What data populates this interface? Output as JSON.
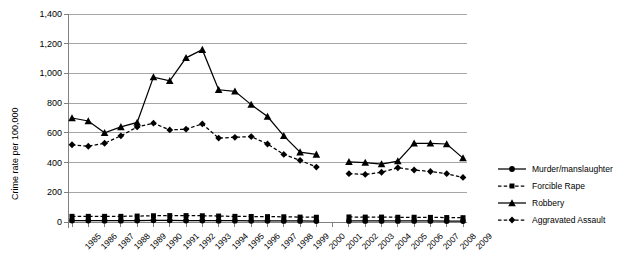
{
  "chart_data": {
    "type": "line",
    "title": "",
    "xlabel": "",
    "ylabel": "Crime rate per 100,000",
    "ylim": [
      0,
      1400
    ],
    "ytick_step": 200,
    "yticks": [
      "0",
      "200",
      "400",
      "600",
      "800",
      "1,000",
      "1,200",
      "1,400"
    ],
    "grid": true,
    "legend_position": "right",
    "gap_years": [
      "2001"
    ],
    "categories": [
      "1985",
      "1986",
      "1987",
      "1988",
      "1989",
      "1990",
      "1991",
      "1992",
      "1993",
      "1994",
      "1995",
      "1996",
      "1997",
      "1998",
      "1999",
      "2000",
      "2001",
      "2002",
      "2003",
      "2004",
      "2005",
      "2006",
      "2007",
      "2008",
      "2009"
    ],
    "series": [
      {
        "name": "Murder/manslaughter",
        "marker": "circle",
        "dash": "solid",
        "color": "#000000",
        "values": [
          10,
          10,
          9,
          9,
          10,
          11,
          11,
          10,
          10,
          9,
          9,
          8,
          8,
          7,
          7,
          6,
          null,
          7,
          7,
          7,
          7,
          7,
          7,
          6,
          6
        ]
      },
      {
        "name": "Forcible Rape",
        "marker": "square",
        "dash": "dashed",
        "color": "#000000",
        "values": [
          38,
          38,
          38,
          38,
          40,
          42,
          43,
          43,
          42,
          40,
          38,
          37,
          36,
          35,
          33,
          32,
          null,
          34,
          33,
          33,
          32,
          32,
          31,
          30,
          29
        ]
      },
      {
        "name": "Robbery",
        "marker": "triangle",
        "dash": "solid",
        "color": "#000000",
        "values": [
          700,
          680,
          600,
          640,
          670,
          975,
          950,
          1105,
          1160,
          890,
          880,
          790,
          710,
          580,
          470,
          455,
          null,
          405,
          400,
          390,
          410,
          530,
          530,
          525,
          430
        ]
      },
      {
        "name": "Aggravated Assault",
        "marker": "diamond",
        "dash": "dashed",
        "color": "#000000",
        "values": [
          520,
          510,
          530,
          580,
          640,
          665,
          620,
          625,
          660,
          565,
          570,
          575,
          525,
          455,
          415,
          370,
          null,
          325,
          320,
          335,
          365,
          350,
          340,
          325,
          300
        ]
      }
    ]
  },
  "legend": {
    "items": [
      {
        "label": "Murder/manslaughter"
      },
      {
        "label": "Forcible Rape"
      },
      {
        "label": "Robbery"
      },
      {
        "label": "Aggravated Assault"
      }
    ]
  },
  "axis": {
    "y_title": "Crime rate per 100,000"
  }
}
